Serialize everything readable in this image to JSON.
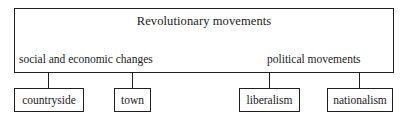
{
  "diagram": {
    "type": "hierarchy-tree",
    "title": "Revolutionary movements",
    "branches": [
      {
        "label": "social and economic changes",
        "children": [
          "countryside",
          "town"
        ]
      },
      {
        "label": "political movements",
        "children": [
          "liberalism",
          "nationalism"
        ]
      }
    ],
    "nodes": {
      "countryside": "countryside",
      "town": "town",
      "liberalism": "liberalism",
      "nationalism": "nationalism"
    },
    "colors": {
      "line": "#1f1f1f",
      "text": "#1a1a1a",
      "background": "#ffffff"
    }
  }
}
